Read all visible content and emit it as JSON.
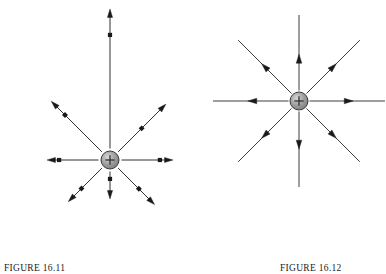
{
  "page": {
    "background": "#ffffff",
    "ink": "#1a1a1a",
    "charge_fill": "#9e9e9e",
    "charge_stroke": "#3a3a3a",
    "width": 386,
    "height": 274
  },
  "figures": [
    {
      "id": "figure-16-11",
      "caption": "FIGURE 16.11",
      "charge": {
        "label": "+",
        "sign": "positive",
        "cx": 110,
        "cy": 160,
        "r": 9
      },
      "description": "Electric field force vectors of unequal magnitude radiating outward from a positive point charge",
      "vectors": [
        {
          "name": "vector-up",
          "angle_deg": 90,
          "length": 150,
          "dot_at": 0.82,
          "head": "tip"
        },
        {
          "name": "vector-up-right",
          "angle_deg": 45,
          "length": 78,
          "dot_at": 0.5,
          "head": "tip"
        },
        {
          "name": "vector-right",
          "angle_deg": 0,
          "length": 62,
          "dot_at": 0.76,
          "head": "tip"
        },
        {
          "name": "vector-down-right",
          "angle_deg": -45,
          "length": 62,
          "dot_at": 0.58,
          "head": "tip"
        },
        {
          "name": "vector-down",
          "angle_deg": -90,
          "length": 38,
          "dot_at": 0.28,
          "head": "tip"
        },
        {
          "name": "vector-down-left",
          "angle_deg": -135,
          "length": 58,
          "dot_at": 0.62,
          "head": "tip"
        },
        {
          "name": "vector-left",
          "angle_deg": 180,
          "length": 62,
          "dot_at": 0.78,
          "head": "tip"
        },
        {
          "name": "vector-up-left",
          "angle_deg": 135,
          "length": 82,
          "dot_at": 0.74,
          "head": "tip"
        }
      ]
    },
    {
      "id": "figure-16-12",
      "caption": "FIGURE 16.12",
      "charge": {
        "label": "+",
        "sign": "positive",
        "cx": 103,
        "cy": 101,
        "r": 9
      },
      "description": "Electric field lines of equal length radiating outward from a positive point charge, each with a midpoint arrowhead",
      "vectors": [
        {
          "name": "field-line-up",
          "angle_deg": 90,
          "length": 86,
          "head_at": 0.42
        },
        {
          "name": "field-line-up-right",
          "angle_deg": 45,
          "length": 86,
          "head_at": 0.5
        },
        {
          "name": "field-line-right",
          "angle_deg": 0,
          "length": 86,
          "head_at": 0.52
        },
        {
          "name": "field-line-down-right",
          "angle_deg": -45,
          "length": 86,
          "head_at": 0.5
        },
        {
          "name": "field-line-down",
          "angle_deg": -90,
          "length": 86,
          "head_at": 0.44
        },
        {
          "name": "field-line-down-left",
          "angle_deg": -135,
          "length": 86,
          "head_at": 0.5
        },
        {
          "name": "field-line-left",
          "angle_deg": 180,
          "length": 86,
          "head_at": 0.48
        },
        {
          "name": "field-line-up-left",
          "angle_deg": 135,
          "length": 86,
          "head_at": 0.5
        }
      ]
    }
  ]
}
